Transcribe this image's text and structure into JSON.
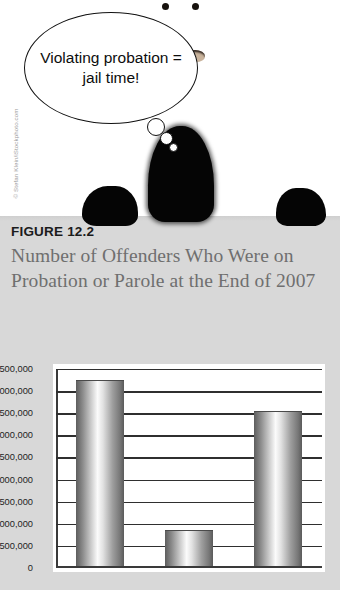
{
  "illustration": {
    "credit": "© Stefan Klein/iStockphoto.com",
    "thought_bubble": "Violating probation = jail time!",
    "character": "masked-figure"
  },
  "figure": {
    "label": "FIGURE 12.2",
    "title": "Number of Offenders Who Were on Probation or Parole at the End of 2007"
  },
  "colors": {
    "panel": "#d8d8d8",
    "plot_background": "#ffffff",
    "axis": "#3a3a3a",
    "title_text": "#6f6f6f",
    "bar_dark": "#5d5d5d",
    "bar_light": "#fbfbfb"
  },
  "chart_data": {
    "type": "bar",
    "title": "Number of Offenders Who Were on Probation or Parole at the End of 2007",
    "xlabel": "",
    "ylabel": "",
    "categories": [
      "Probation",
      "Parole",
      "Population of"
    ],
    "values": [
      4200000,
      800000,
      3500000
    ],
    "ylim": [
      0,
      4500000
    ],
    "yticks": [
      0,
      500000,
      1000000,
      1500000,
      2000000,
      2500000,
      3000000,
      3500000,
      4000000,
      4500000
    ],
    "ytick_labels": [
      "4,500,000",
      "4,000,000",
      "3,500,000",
      "3,000,000",
      "2,500,000",
      "2,000,000",
      "1,500,000",
      "1,000,000",
      "500,000",
      "0"
    ],
    "grid": true,
    "legend": false,
    "bar_style": "cylindrical-gradient"
  }
}
